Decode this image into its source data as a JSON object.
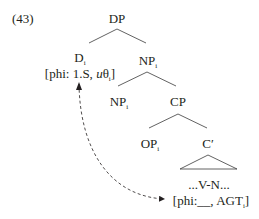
{
  "example_number": "(43)",
  "tree": {
    "root": {
      "label": "DP"
    },
    "d": {
      "label": "D",
      "index": "i",
      "features_prefix": "[phi: 1.S, ",
      "features_u": "u",
      "features_theta": "θ",
      "features_index": "i",
      "features_suffix": "]"
    },
    "np_upper": {
      "label": "NP",
      "index": "i"
    },
    "np_lower": {
      "label": "NP",
      "index": "i"
    },
    "cp": {
      "label": "CP"
    },
    "op": {
      "label": "OP",
      "index": "i"
    },
    "c_bar": {
      "label": "C′"
    },
    "vn": {
      "label": "...V-N..."
    },
    "vn_features": {
      "prefix": "[phi:__, AGT",
      "index": "i",
      "suffix": "]"
    }
  },
  "arrow": {
    "style": "dashed",
    "direction": "bidirectional",
    "from": "vn_features",
    "to": "d_features"
  },
  "colors": {
    "ink": "#231f20",
    "lines": "#3a3a3a"
  }
}
